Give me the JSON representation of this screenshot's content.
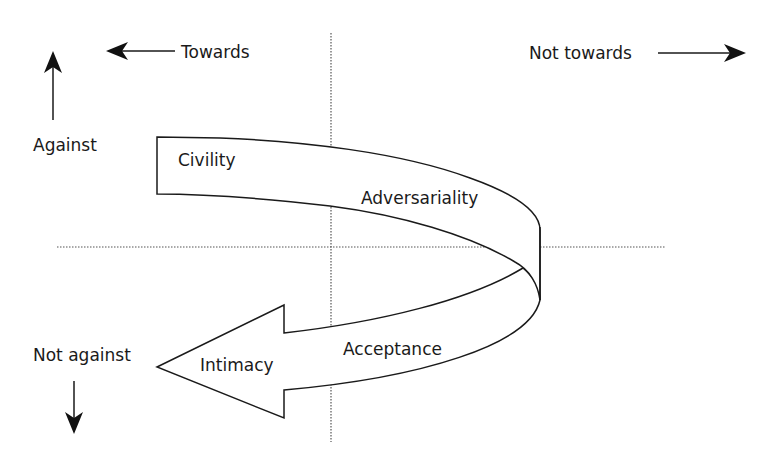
{
  "diagram": {
    "directions": {
      "towards": "Towards",
      "not_towards": "Not towards",
      "against": "Against",
      "not_against": "Not against"
    },
    "stages": [
      {
        "label": "Civility"
      },
      {
        "label": "Adversariality"
      },
      {
        "label": "Acceptance"
      },
      {
        "label": "Intimacy"
      }
    ],
    "icons": {
      "towards": "arrow-left-icon",
      "not_towards": "arrow-right-icon",
      "against": "arrow-up-icon",
      "not_against": "arrow-down-icon"
    },
    "colors": {
      "ink": "#1a1a1a",
      "axis": "#555555",
      "background": "#ffffff"
    }
  }
}
